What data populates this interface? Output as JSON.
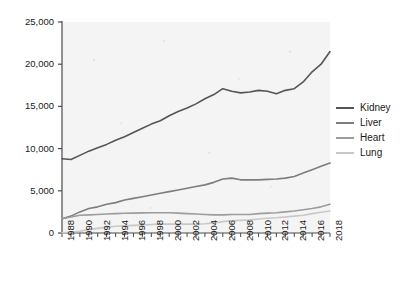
{
  "chart_data": {
    "type": "line",
    "title": "",
    "xlabel": "",
    "ylabel": "",
    "xlim": [
      1988,
      2018
    ],
    "ylim": [
      0,
      25000
    ],
    "grid": false,
    "legend_position": "right",
    "y_ticks": [
      "0",
      "5,000",
      "10,000",
      "15,000",
      "20,000",
      "25,000"
    ],
    "y_tick_values": [
      0,
      5000,
      10000,
      15000,
      20000,
      25000
    ],
    "x_ticks": [
      "1988",
      "1990",
      "1992",
      "1994",
      "1996",
      "1998",
      "2000",
      "2002",
      "2004",
      "2006",
      "2008",
      "2010",
      "2012",
      "2014",
      "2016",
      "2018"
    ],
    "x_tick_values": [
      1988,
      1990,
      1992,
      1994,
      1996,
      1998,
      2000,
      2002,
      2004,
      2006,
      2008,
      2010,
      2012,
      2014,
      2016,
      2018
    ],
    "x": [
      1988,
      1989,
      1990,
      1991,
      1992,
      1993,
      1994,
      1995,
      1996,
      1997,
      1998,
      1999,
      2000,
      2001,
      2002,
      2003,
      2004,
      2005,
      2006,
      2007,
      2008,
      2009,
      2010,
      2011,
      2012,
      2013,
      2014,
      2015,
      2016,
      2017,
      2018
    ],
    "series": [
      {
        "name": "Kidney",
        "color": "#555555",
        "values": [
          8800,
          8700,
          9200,
          9700,
          10100,
          10500,
          11000,
          11400,
          11900,
          12400,
          12900,
          13300,
          13900,
          14400,
          14800,
          15300,
          15900,
          16400,
          17100,
          16800,
          16600,
          16700,
          16900,
          16800,
          16500,
          16900,
          17100,
          17900,
          19100,
          20000,
          21500
        ]
      },
      {
        "name": "Liver",
        "color": "#7d7d7d",
        "values": [
          1700,
          2000,
          2500,
          2900,
          3100,
          3400,
          3600,
          3900,
          4100,
          4300,
          4500,
          4700,
          4900,
          5100,
          5300,
          5500,
          5700,
          6000,
          6400,
          6500,
          6300,
          6300,
          6300,
          6350,
          6400,
          6500,
          6700,
          7100,
          7500,
          7900,
          8300
        ]
      },
      {
        "name": "Heart",
        "color": "#9c9c9c",
        "values": [
          1700,
          1900,
          2100,
          2150,
          2200,
          2250,
          2300,
          2340,
          2360,
          2380,
          2400,
          2400,
          2400,
          2350,
          2300,
          2250,
          2200,
          2150,
          2150,
          2200,
          2200,
          2200,
          2300,
          2350,
          2400,
          2500,
          2600,
          2750,
          2900,
          3100,
          3400
        ]
      },
      {
        "name": "Lung",
        "color": "#c8c8c8",
        "values": [
          30,
          90,
          200,
          400,
          550,
          700,
          800,
          850,
          900,
          950,
          1000,
          1050,
          1050,
          1050,
          1050,
          1050,
          1100,
          1200,
          1350,
          1450,
          1500,
          1550,
          1650,
          1750,
          1800,
          1900,
          2000,
          2100,
          2300,
          2450,
          2600
        ]
      }
    ]
  },
  "legend": {
    "items": [
      {
        "label": "Kidney"
      },
      {
        "label": "Liver"
      },
      {
        "label": "Heart"
      },
      {
        "label": "Lung"
      }
    ]
  }
}
